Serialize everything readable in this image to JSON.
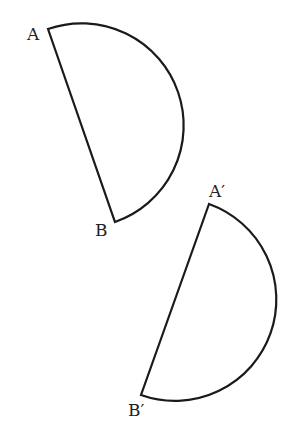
{
  "figure": {
    "shape1": {
      "label_start": "A",
      "label_end": "B"
    },
    "shape2": {
      "label_start": "A′",
      "label_end": "B′"
    }
  }
}
